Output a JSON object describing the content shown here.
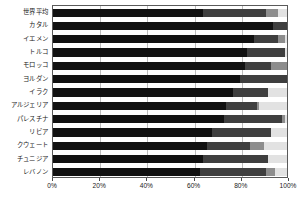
{
  "chart_data": {
    "type": "bar",
    "orientation": "horizontal",
    "stacked": "100%",
    "title": "",
    "subtitle": "",
    "xlabel": "",
    "ylabel": "",
    "xlim": [
      0,
      100
    ],
    "grid": true,
    "legend": "none",
    "xticks": [
      "0%",
      "20%",
      "40%",
      "60%",
      "80%",
      "100%"
    ],
    "xtick_values": [
      0,
      20,
      40,
      60,
      80,
      100
    ],
    "categories": [
      "世界平均",
      "カタル",
      "イエメン",
      "トルコ",
      "モロッコ",
      "ヨルダン",
      "イラク",
      "アルジェリア",
      "パレスチナ",
      "リビア",
      "クウェート",
      "チュニジア",
      "レバノン"
    ],
    "series": [
      {
        "name": "segment-1",
        "color": "#111111",
        "values": [
          64,
          94,
          86,
          83,
          82,
          80,
          77,
          74,
          73,
          68,
          66,
          64,
          63
        ]
      },
      {
        "name": "segment-2",
        "color": "#3f3f3f",
        "values": [
          27,
          6,
          10,
          16,
          11,
          20,
          15,
          13,
          25,
          25,
          18,
          28,
          28
        ]
      },
      {
        "name": "segment-3",
        "color": "#8d8d8d",
        "values": [
          5,
          0,
          3,
          0,
          7,
          0,
          0,
          1,
          1,
          0,
          6,
          0,
          4
        ]
      },
      {
        "name": "segment-4",
        "color": "#e2e2e2",
        "values": [
          4,
          0,
          1,
          1,
          0,
          0,
          8,
          12,
          1,
          7,
          10,
          8,
          5
        ]
      }
    ]
  },
  "axis": {
    "plot_border_color": "#5a5a5a",
    "gridline_color": "#bdbdbd"
  }
}
